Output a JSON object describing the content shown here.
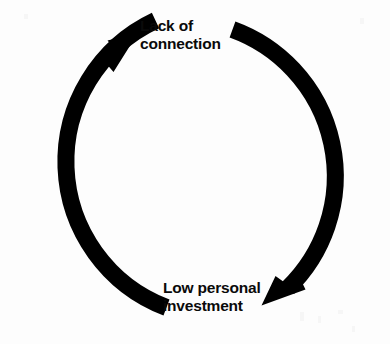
{
  "diagram": {
    "type": "cycle",
    "title": "",
    "background_color": "#fdfdfd",
    "stroke_color": "#000000",
    "text_color": "#0a0a0a",
    "direction": "clockwise",
    "geometry": {
      "center_x": 192,
      "center_y": 168,
      "radius": 156,
      "stroke_width": 17
    },
    "nodes": [
      {
        "id": "lack-of-connection",
        "position": "top",
        "line1": "Lack of",
        "line2": "connection"
      },
      {
        "id": "low-personal-investment",
        "position": "bottom-right",
        "line1": "Low personal",
        "line2": "investment"
      }
    ],
    "arrows": [
      {
        "id": "arrow-to-lack-of-connection",
        "points_to": "lack-of-connection",
        "tip_x": 137,
        "tip_y": 35,
        "direction": "up-right"
      },
      {
        "id": "arrow-to-low-personal-investment",
        "points_to": "low-personal-investment",
        "tip_x": 262,
        "tip_y": 305,
        "direction": "down-left"
      }
    ]
  }
}
